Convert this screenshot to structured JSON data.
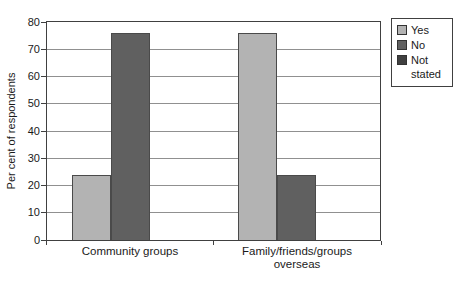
{
  "chart_data": {
    "type": "bar",
    "title": "",
    "xlabel": "",
    "ylabel": "Per cent of respondents",
    "ylim": [
      0,
      80
    ],
    "yticks": [
      0,
      10,
      20,
      30,
      40,
      50,
      60,
      70,
      80
    ],
    "grid": true,
    "legend_position": "top-right-outside",
    "categories": [
      "Community groups",
      "Family/friends/groups overseas"
    ],
    "series": [
      {
        "name": "Yes",
        "color": "#b3b3b3",
        "values": [
          24,
          76
        ]
      },
      {
        "name": "No",
        "color": "#606060",
        "values": [
          76,
          24
        ]
      },
      {
        "name": "Not stated",
        "color": "#404040",
        "values": [
          0,
          0
        ]
      }
    ],
    "colors": {
      "gridline": "#909090",
      "frame": "#404040",
      "text": "#1a1a1a",
      "background": "#ffffff"
    }
  }
}
